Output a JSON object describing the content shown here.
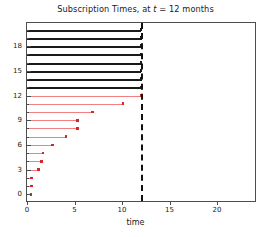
{
  "chart_data": {
    "type": "bar",
    "title": "Subscription Times, at t = 12  months",
    "title_prefix": "Subscription Times, at ",
    "title_var": "t",
    "title_suffix": " = 12  months",
    "xlabel": "time",
    "ylabel": "",
    "xlim": [
      0,
      24
    ],
    "ylim": [
      -0.8,
      20.8
    ],
    "xticks": [
      0,
      5,
      10,
      15,
      20
    ],
    "xticklabels": [
      "0",
      "5",
      "10",
      "15",
      "20"
    ],
    "yticks": [
      0,
      3,
      6,
      9,
      12,
      15,
      18
    ],
    "yticklabels": [
      "0",
      "3",
      "6",
      "9",
      "12",
      "15",
      "18"
    ],
    "y_minor_ticks": [
      1,
      2,
      4,
      5,
      7,
      8,
      10,
      11,
      13,
      14,
      16,
      17,
      19,
      20
    ],
    "grid": false,
    "legend": null,
    "annotations": [
      {
        "name": "current-time-line",
        "type": "vline",
        "x": 12,
        "style": "dashed",
        "color": "#111111"
      }
    ],
    "colors": {
      "censored": "#1a1a1a",
      "event_line": "#f08080",
      "event_marker": "#d62728",
      "axis": "#4d4d4d",
      "vline": "#111111"
    },
    "series": [
      {
        "name": "censored",
        "color": "#1a1a1a",
        "marker": false,
        "items": [
          {
            "subject": 20,
            "start": 0,
            "end": 12
          },
          {
            "subject": 19,
            "start": 0,
            "end": 12
          },
          {
            "subject": 18,
            "start": 0,
            "end": 12
          },
          {
            "subject": 17,
            "start": 0,
            "end": 12
          },
          {
            "subject": 16,
            "start": 0,
            "end": 12
          },
          {
            "subject": 15,
            "start": 0,
            "end": 12
          },
          {
            "subject": 14,
            "start": 0,
            "end": 12
          },
          {
            "subject": 13,
            "start": 0,
            "end": 12
          }
        ]
      },
      {
        "name": "event",
        "color": "#f08080",
        "marker": true,
        "items": [
          {
            "subject": 12,
            "start": 0,
            "end": 12.0
          },
          {
            "subject": 11,
            "start": 0,
            "end": 10.1
          },
          {
            "subject": 10,
            "start": 0,
            "end": 6.9
          },
          {
            "subject": 9,
            "start": 0,
            "end": 5.3
          },
          {
            "subject": 8,
            "start": 0,
            "end": 5.3
          },
          {
            "subject": 7,
            "start": 0,
            "end": 4.1
          },
          {
            "subject": 6,
            "start": 0,
            "end": 2.7
          },
          {
            "subject": 5,
            "start": 0,
            "end": 1.7
          },
          {
            "subject": 4,
            "start": 0,
            "end": 1.5
          },
          {
            "subject": 3,
            "start": 0,
            "end": 1.2
          },
          {
            "subject": 2,
            "start": 0,
            "end": 0.5
          },
          {
            "subject": 1,
            "start": 0,
            "end": 0.45
          },
          {
            "subject": 0,
            "start": 0,
            "end": 0.4
          }
        ]
      }
    ]
  }
}
